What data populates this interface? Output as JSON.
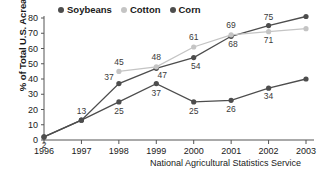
{
  "chart_data": {
    "type": "line",
    "title": "",
    "xlabel": "",
    "ylabel": "% of Total U.S. Acreage",
    "source_caption": "National Agricultural Statistics Service",
    "categories": [
      "1996",
      "1997",
      "1998",
      "1999",
      "2000",
      "2001",
      "2002",
      "2003"
    ],
    "ylim": [
      0,
      80
    ],
    "yticks": [
      0,
      10,
      20,
      30,
      40,
      50,
      60,
      70,
      80
    ],
    "grid": false,
    "legend_position": "top-center",
    "series": [
      {
        "name": "Soybeans",
        "color": "#4d4d4d",
        "x": [
          "1996",
          "1997",
          "1998",
          "1999",
          "2000",
          "2001",
          "2002",
          "2003"
        ],
        "values": [
          2,
          13,
          37,
          47,
          54,
          68,
          75,
          81
        ],
        "labels": [
          "2",
          "13",
          "37",
          "47",
          "54",
          "68",
          "75",
          "81"
        ]
      },
      {
        "name": "Cotton",
        "color": "#c4c4c4",
        "x": [
          "1998",
          "1999",
          "2000",
          "2001",
          "2002",
          "2003"
        ],
        "values": [
          45,
          48,
          61,
          69,
          71,
          73
        ],
        "labels": [
          "45",
          "48",
          "61",
          "69",
          "71",
          "73"
        ]
      },
      {
        "name": "Corn",
        "color": "#4d4d4d",
        "x": [
          "1996",
          "1997",
          "1998",
          "1999",
          "2000",
          "2001",
          "2002",
          "2003"
        ],
        "values": [
          2,
          13,
          25,
          37,
          25,
          26,
          34,
          40
        ],
        "labels": [
          "",
          "",
          "25",
          "37",
          "25",
          "26",
          "34",
          "40"
        ]
      }
    ]
  },
  "legend": {
    "items": [
      {
        "label": "Soybeans",
        "color": "#4d4d4d"
      },
      {
        "label": "Cotton",
        "color": "#c4c4c4"
      },
      {
        "label": "Corn",
        "color": "#4d4d4d"
      }
    ]
  },
  "axis": {
    "y_title": "% of Total U.S. Acreage",
    "y_ticks": [
      "80",
      "70",
      "60",
      "50",
      "40",
      "30",
      "20",
      "10",
      "0"
    ],
    "x_ticks": [
      "1996",
      "1997",
      "1998",
      "1999",
      "2000",
      "2001",
      "2002",
      "2003"
    ]
  },
  "caption": {
    "text": "National Agricultural Statistics Service"
  }
}
